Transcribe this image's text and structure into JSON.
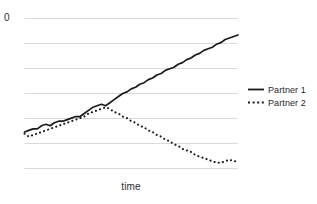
{
  "chart_data": {
    "type": "line",
    "title": "",
    "xlabel": "time",
    "ylabel": "",
    "grid": true,
    "gridlines_y": [
      18,
      43,
      68,
      93,
      118,
      143,
      168
    ],
    "y_tick_labels": [
      "0"
    ],
    "x_tick_labels": [],
    "xlim": [
      0,
      100
    ],
    "ylim": [
      0,
      100
    ],
    "legend_position": "right",
    "series": [
      {
        "name": "Partner 1",
        "style": "solid",
        "color": "#1a1a1a",
        "x": [
          0,
          2,
          4,
          6,
          8,
          10,
          12,
          14,
          16,
          18,
          20,
          22,
          24,
          26,
          28,
          30,
          32,
          34,
          36,
          38,
          40,
          42,
          44,
          46,
          48,
          50,
          52,
          54,
          56,
          58,
          60,
          62,
          64,
          66,
          68,
          70,
          72,
          74,
          76,
          78,
          80,
          82,
          84,
          86,
          88,
          90,
          92,
          94,
          96,
          98,
          100
        ],
        "values": [
          26,
          27,
          28,
          28,
          30,
          31,
          30,
          32,
          33,
          33,
          34,
          35,
          36,
          36,
          38,
          40,
          42,
          43,
          44,
          43,
          45,
          47,
          49,
          51,
          52,
          54,
          55,
          57,
          58,
          60,
          61,
          63,
          64,
          66,
          67,
          68,
          70,
          71,
          73,
          74,
          76,
          77,
          79,
          80,
          81,
          83,
          84,
          86,
          87,
          88,
          89
        ]
      },
      {
        "name": "Partner 2",
        "style": "dotted",
        "color": "#1a1a1a",
        "x": [
          0,
          2,
          4,
          6,
          8,
          10,
          12,
          14,
          16,
          18,
          20,
          22,
          24,
          26,
          28,
          30,
          32,
          34,
          36,
          38,
          40,
          42,
          44,
          46,
          48,
          50,
          52,
          54,
          56,
          58,
          60,
          62,
          64,
          66,
          68,
          70,
          72,
          74,
          76,
          78,
          80,
          82,
          84,
          86,
          88,
          90,
          92,
          94,
          96,
          98,
          100
        ],
        "values": [
          25,
          23,
          24,
          25,
          26,
          27,
          28,
          29,
          30,
          31,
          32,
          33,
          34,
          35,
          36,
          38,
          39,
          40,
          41,
          42,
          41,
          39,
          38,
          36,
          35,
          33,
          32,
          30,
          29,
          27,
          26,
          24,
          23,
          21,
          20,
          18,
          17,
          15,
          14,
          13,
          11,
          10,
          9,
          8,
          7,
          6,
          6,
          7,
          8,
          7,
          7
        ]
      }
    ]
  },
  "axes": {
    "y_top_label": "0",
    "x_label": "time"
  },
  "legend": {
    "items": [
      {
        "label": "Partner 1",
        "style": "solid"
      },
      {
        "label": "Partner 2",
        "style": "dotted"
      }
    ]
  },
  "colors": {
    "background": "#ffffff",
    "grid": "#d9d9d9",
    "line": "#1a1a1a",
    "text": "#1f1f1f"
  }
}
